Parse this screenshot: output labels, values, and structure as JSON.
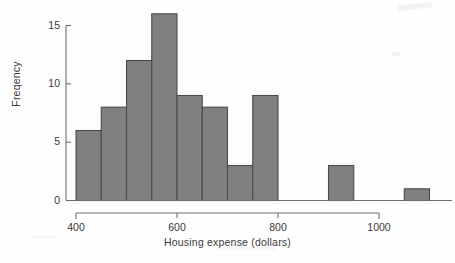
{
  "chart_data": {
    "type": "bar",
    "title": "",
    "subtitle": "",
    "xlabel": "Housing expense (dollars)",
    "ylabel": "Freqency",
    "grid": false,
    "legend": false,
    "legend_position": "none",
    "bin_width": 50,
    "xlim": [
      400,
      1100
    ],
    "ylim": [
      0,
      16
    ],
    "xticks": [
      400,
      600,
      800,
      1000
    ],
    "xtick_labels": [
      "400",
      "600",
      "800",
      "1000"
    ],
    "yticks": [
      0,
      5,
      10,
      15
    ],
    "ytick_labels": [
      "0",
      "5",
      "10",
      "15"
    ],
    "bar_fill": "#808080",
    "bar_stroke": "#4a4a4a",
    "axis_color": "#6e6e6e",
    "categories": [
      "400-450",
      "450-500",
      "500-550",
      "550-600",
      "600-650",
      "650-700",
      "700-750",
      "750-800",
      "800-850",
      "850-900",
      "900-950",
      "950-1000",
      "1000-1050",
      "1050-1100"
    ],
    "bins": [
      {
        "start": 400,
        "end": 450,
        "count": 6
      },
      {
        "start": 450,
        "end": 500,
        "count": 8
      },
      {
        "start": 500,
        "end": 550,
        "count": 12
      },
      {
        "start": 550,
        "end": 600,
        "count": 16
      },
      {
        "start": 600,
        "end": 650,
        "count": 9
      },
      {
        "start": 650,
        "end": 700,
        "count": 8
      },
      {
        "start": 700,
        "end": 750,
        "count": 3
      },
      {
        "start": 750,
        "end": 800,
        "count": 9
      },
      {
        "start": 800,
        "end": 850,
        "count": 0
      },
      {
        "start": 850,
        "end": 900,
        "count": 0
      },
      {
        "start": 900,
        "end": 950,
        "count": 3
      },
      {
        "start": 950,
        "end": 1000,
        "count": 0
      },
      {
        "start": 1000,
        "end": 1050,
        "count": 0
      },
      {
        "start": 1050,
        "end": 1100,
        "count": 1
      }
    ],
    "values": [
      6,
      8,
      12,
      16,
      9,
      8,
      3,
      9,
      0,
      0,
      3,
      0,
      0,
      1
    ]
  }
}
